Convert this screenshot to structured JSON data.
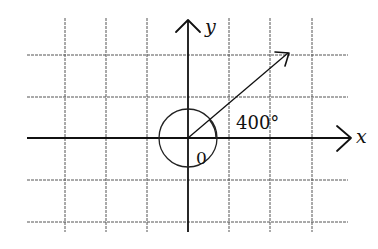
{
  "diagram": {
    "type": "angle-in-standard-position",
    "axes": {
      "x_label": "x",
      "y_label": "y"
    },
    "origin_label": "0",
    "angle_label": "400°",
    "angle_degrees": 400,
    "terminal_angle_degrees": 40,
    "full_rotations": 1,
    "grid": {
      "columns": 8,
      "rows": 5,
      "cell_size_px": 41
    },
    "colors": {
      "lines": "#111111",
      "grid": "#555555",
      "background": "#ffffff"
    }
  }
}
